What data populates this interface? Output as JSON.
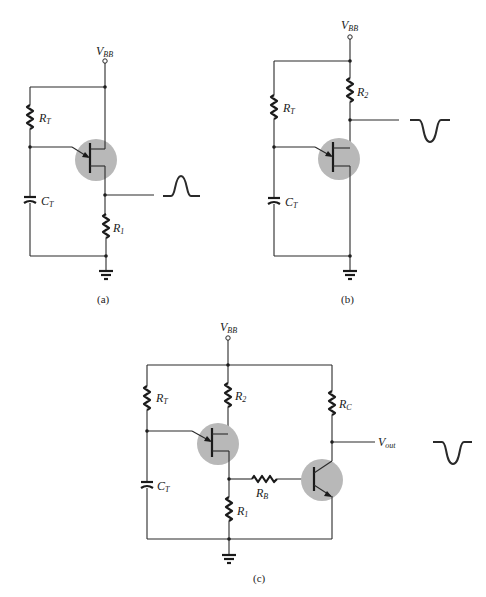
{
  "figure": {
    "panels": [
      {
        "id": "a",
        "caption": "(a)",
        "supply_label": {
          "main": "V",
          "sub": "BB"
        },
        "components": {
          "rt": {
            "main": "R",
            "sub": "T"
          },
          "ct": {
            "main": "C",
            "sub": "T"
          },
          "r1": {
            "main": "R",
            "sub": "1"
          }
        },
        "transistor": "UJT",
        "output_waveform": "positive-pulse"
      },
      {
        "id": "b",
        "caption": "(b)",
        "supply_label": {
          "main": "V",
          "sub": "BB"
        },
        "components": {
          "rt": {
            "main": "R",
            "sub": "T"
          },
          "ct": {
            "main": "C",
            "sub": "T"
          },
          "r2": {
            "main": "R",
            "sub": "2"
          }
        },
        "transistor": "UJT",
        "output_waveform": "negative-pulse"
      },
      {
        "id": "c",
        "caption": "(c)",
        "supply_label": {
          "main": "V",
          "sub": "BB"
        },
        "components": {
          "rt": {
            "main": "R",
            "sub": "T"
          },
          "ct": {
            "main": "C",
            "sub": "T"
          },
          "r1": {
            "main": "R",
            "sub": "1"
          },
          "r2": {
            "main": "R",
            "sub": "2"
          },
          "rb": {
            "main": "R",
            "sub": "B"
          },
          "rc": {
            "main": "R",
            "sub": "C"
          }
        },
        "output_label": {
          "main": "V",
          "sub": "out"
        },
        "transistors": [
          "UJT",
          "NPN-BJT"
        ],
        "output_waveform": "negative-pulse"
      }
    ],
    "colors": {
      "wire": "#2a2a2a",
      "transistor_shade": "#b8b8b8",
      "background": "#ffffff"
    }
  }
}
